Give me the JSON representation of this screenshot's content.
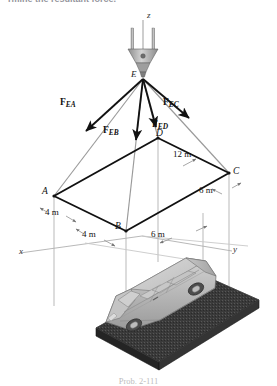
{
  "page": {
    "heading_fragment": "rmine the resultant force.",
    "caption": "Prob. 2-111"
  },
  "figure": {
    "axes": [
      {
        "name": "z",
        "label": "z"
      },
      {
        "name": "x",
        "label": "x"
      },
      {
        "name": "y",
        "label": "y"
      }
    ],
    "points": [
      {
        "id": "E",
        "label": "E"
      },
      {
        "id": "A",
        "label": "A"
      },
      {
        "id": "B",
        "label": "B"
      },
      {
        "id": "C",
        "label": "C"
      },
      {
        "id": "D",
        "label": "D"
      }
    ],
    "forces": [
      {
        "id": "FEA",
        "base": "F",
        "sub": "EA"
      },
      {
        "id": "FEB",
        "base": "F",
        "sub": "EB"
      },
      {
        "id": "FEC",
        "base": "F",
        "sub": "EC"
      },
      {
        "id": "FED",
        "base": "F",
        "sub": "ED"
      }
    ],
    "dimensions": [
      {
        "id": "dim-12m",
        "label": "12 m"
      },
      {
        "id": "dim-6m-right",
        "label": "6 m"
      },
      {
        "id": "dim-6m-bottom",
        "label": "6 m"
      },
      {
        "id": "dim-4m-upper",
        "label": "4 m"
      },
      {
        "id": "dim-4m-lower",
        "label": "4 m"
      }
    ],
    "colors": {
      "cable": "#9a9a9a",
      "force_arrow": "#121212",
      "platform_side": "#2e2e2e",
      "platform_top": "#4a4a4a",
      "van_body": "#b9b9b9",
      "van_glass": "#cfcfcf",
      "guide_line": "#b5b5b5",
      "hook_metal": "#a8a8a8"
    }
  }
}
